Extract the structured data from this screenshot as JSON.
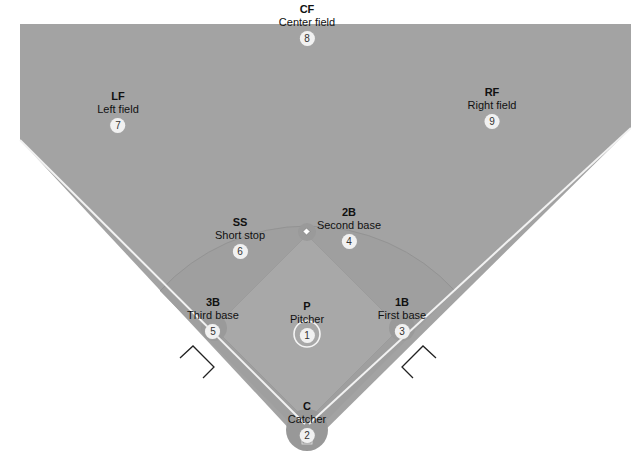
{
  "diagram": {
    "colors": {
      "outfield": "#a3a3a3",
      "infield_arc": "#9e9e9e",
      "infield_diamond": "#a6a6a6",
      "foul_line": "#f2f2f2",
      "background": "#ffffff",
      "label_text": "#111111",
      "number_badge": "#f1f1f1"
    },
    "positions": [
      {
        "abbr": "CF",
        "name": "Center field",
        "number": "8"
      },
      {
        "abbr": "LF",
        "name": "Left field",
        "number": "7"
      },
      {
        "abbr": "RF",
        "name": "Right field",
        "number": "9"
      },
      {
        "abbr": "SS",
        "name": "Short stop",
        "number": "6"
      },
      {
        "abbr": "2B",
        "name": "Second base",
        "number": "4"
      },
      {
        "abbr": "3B",
        "name": "Third base",
        "number": "5"
      },
      {
        "abbr": "P",
        "name": "Pitcher",
        "number": "1"
      },
      {
        "abbr": "1B",
        "name": "First base",
        "number": "3"
      },
      {
        "abbr": "C",
        "name": "Catcher",
        "number": "2"
      }
    ]
  }
}
